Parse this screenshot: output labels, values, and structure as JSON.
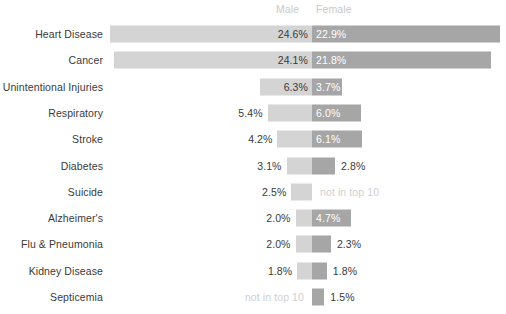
{
  "legend": {
    "male_label": "Male",
    "female_label": "Female"
  },
  "not_in_top_10_text": "not in top 10",
  "colors": {
    "male_bar": "#d4d4d4",
    "female_bar": "#a6a6a6",
    "label_text": "#3a3a3a",
    "muted_text": "#cfcfcf",
    "inside_text": "#ffffff",
    "background": "#ffffff"
  },
  "chart_data": {
    "type": "bar",
    "subtype": "diverging-tornado",
    "title": "",
    "subtitle": "",
    "xlabel": "",
    "ylabel": "",
    "grid": false,
    "legend_position": "top-center",
    "value_suffix": "%",
    "categories": [
      "Heart Disease",
      "Cancer",
      "Unintentional Injuries",
      "Respiratory",
      "Stroke",
      "Diabetes",
      "Suicide",
      "Alzheimer's",
      "Flu & Pneumonia",
      "Kidney Disease",
      "Septicemia"
    ],
    "series": [
      {
        "name": "Male",
        "direction": "left",
        "values": [
          24.6,
          24.1,
          6.3,
          5.4,
          4.2,
          3.1,
          2.5,
          2.0,
          2.0,
          1.8,
          null
        ],
        "labels": [
          "24.6%",
          "24.1%",
          "6.3%",
          "5.4%",
          "4.2%",
          "3.1%",
          "2.5%",
          "2.0%",
          "2.0%",
          "1.8%",
          "not in top 10"
        ]
      },
      {
        "name": "Female",
        "direction": "right",
        "values": [
          22.9,
          21.8,
          3.7,
          6.0,
          6.1,
          2.8,
          null,
          4.7,
          2.3,
          1.8,
          1.5
        ],
        "labels": [
          "22.9%",
          "21.8%",
          "3.7%",
          "6.0%",
          "6.1%",
          "2.8%",
          "not in top 10",
          "4.7%",
          "2.3%",
          "1.8%",
          "1.5%"
        ]
      }
    ],
    "xlim": [
      -26,
      26
    ]
  }
}
